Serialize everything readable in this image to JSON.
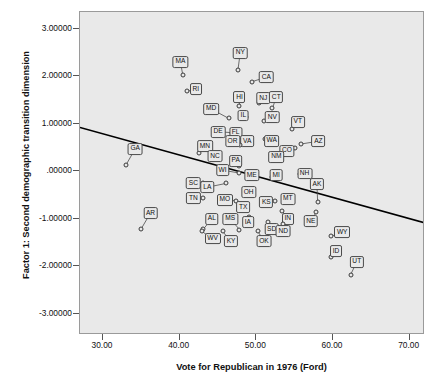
{
  "chart_data": {
    "type": "scatter",
    "title": "",
    "xlabel": "Vote for Republican in 1976 (Ford)",
    "ylabel": "Factor 1: Second demographic transition dimension",
    "xlim": [
      27.0,
      72.0
    ],
    "ylim": [
      -3.45,
      3.35
    ],
    "xticks": [
      "30.00",
      "40.00",
      "50.00",
      "60.00",
      "70.00"
    ],
    "xtick_values": [
      30,
      40,
      50,
      60,
      70
    ],
    "yticks": [
      "3.00000",
      "2.00000",
      "1.00000",
      ".00000",
      "-1.00000",
      "-2.00000",
      "-3.00000"
    ],
    "ytick_values": [
      3,
      2,
      1,
      0,
      -1,
      -2,
      -3
    ],
    "grid": false,
    "legend": null,
    "point_labels": true,
    "background_color": "#e9e9e9",
    "marker_color": "#3a3a3a",
    "line_color": "#000000",
    "fit_line": {
      "type": "linear-regression",
      "x_start": 27.0,
      "y_start": 0.92,
      "x_end": 72.0,
      "y_end": -1.09
    },
    "points": [
      {
        "label": "MA",
        "x": 40.4,
        "y": 2.03,
        "lx": 40.1,
        "ly": 2.3
      },
      {
        "label": "NY",
        "x": 47.6,
        "y": 2.13,
        "lx": 47.9,
        "ly": 2.49
      },
      {
        "label": "CA",
        "x": 49.4,
        "y": 1.88,
        "lx": 51.3,
        "ly": 1.98
      },
      {
        "label": "RI",
        "x": 41.0,
        "y": 1.68,
        "lx": 42.1,
        "ly": 1.73
      },
      {
        "label": "HI",
        "x": 47.8,
        "y": 1.38,
        "lx": 47.8,
        "ly": 1.56
      },
      {
        "label": "NJ",
        "x": 50.4,
        "y": 1.43,
        "lx": 50.9,
        "ly": 1.54
      },
      {
        "label": "CT",
        "x": 52.1,
        "y": 1.32,
        "lx": 52.6,
        "ly": 1.56
      },
      {
        "label": "MD",
        "x": 46.4,
        "y": 1.11,
        "lx": 44.1,
        "ly": 1.31
      },
      {
        "label": "IL",
        "x": 48.6,
        "y": 1.13,
        "lx": 48.3,
        "ly": 1.17
      },
      {
        "label": "NV",
        "x": 51.0,
        "y": 1.05,
        "lx": 52.1,
        "ly": 1.13
      },
      {
        "label": "VT",
        "x": 54.6,
        "y": 0.88,
        "lx": 55.4,
        "ly": 1.04
      },
      {
        "label": "DE",
        "x": 46.8,
        "y": 0.81,
        "lx": 45.0,
        "ly": 0.83
      },
      {
        "label": "FL",
        "x": 47.8,
        "y": 0.79,
        "lx": 47.3,
        "ly": 0.81
      },
      {
        "label": "WA",
        "x": 51.1,
        "y": 0.68,
        "lx": 52.0,
        "ly": 0.64
      },
      {
        "label": "VA",
        "x": 49.0,
        "y": 0.67,
        "lx": 48.8,
        "ly": 0.63
      },
      {
        "label": "OR",
        "x": 47.9,
        "y": 0.56,
        "lx": 46.9,
        "ly": 0.63
      },
      {
        "label": "AZ",
        "x": 55.8,
        "y": 0.57,
        "lx": 58.1,
        "ly": 0.63
      },
      {
        "label": "MN",
        "x": 42.5,
        "y": 0.38,
        "lx": 43.3,
        "ly": 0.53
      },
      {
        "label": "CO",
        "x": 55.1,
        "y": 0.48,
        "lx": 54.0,
        "ly": 0.43
      },
      {
        "label": "NC",
        "x": 44.2,
        "y": 0.25,
        "lx": 44.6,
        "ly": 0.32
      },
      {
        "label": "NM",
        "x": 52.3,
        "y": 0.23,
        "lx": 52.6,
        "ly": 0.3
      },
      {
        "label": "GA",
        "x": 33.0,
        "y": 0.13,
        "lx": 34.2,
        "ly": 0.47
      },
      {
        "label": "PA",
        "x": 47.7,
        "y": 0.1,
        "lx": 47.3,
        "ly": 0.22
      },
      {
        "label": "WI",
        "x": 47.8,
        "y": -0.04,
        "lx": 45.6,
        "ly": 0.02
      },
      {
        "label": "NH",
        "x": 55.7,
        "y": -0.06,
        "lx": 56.3,
        "ly": -0.05
      },
      {
        "label": "ME",
        "x": 49.0,
        "y": -0.11,
        "lx": 49.4,
        "ly": -0.09
      },
      {
        "label": "MI",
        "x": 52.1,
        "y": -0.13,
        "lx": 52.6,
        "ly": -0.08
      },
      {
        "label": "SC",
        "x": 43.1,
        "y": -0.25,
        "lx": 41.8,
        "ly": -0.25
      },
      {
        "label": "LA",
        "x": 46.0,
        "y": -0.26,
        "lx": 43.6,
        "ly": -0.34
      },
      {
        "label": "OH",
        "x": 48.7,
        "y": -0.37,
        "lx": 49.0,
        "ly": -0.44
      },
      {
        "label": "AK",
        "x": 58.0,
        "y": -0.65,
        "lx": 57.9,
        "ly": -0.28
      },
      {
        "label": "TN",
        "x": 43.0,
        "y": -0.57,
        "lx": 41.8,
        "ly": -0.57
      },
      {
        "label": "MT",
        "x": 53.7,
        "y": -0.55,
        "lx": 54.1,
        "ly": -0.58
      },
      {
        "label": "MO",
        "x": 47.3,
        "y": -0.62,
        "lx": 45.9,
        "ly": -0.6
      },
      {
        "label": "KS",
        "x": 52.4,
        "y": -0.62,
        "lx": 51.3,
        "ly": -0.65
      },
      {
        "label": "TX",
        "x": 48.6,
        "y": -0.78,
        "lx": 48.3,
        "ly": -0.76
      },
      {
        "label": "AR",
        "x": 35.0,
        "y": -1.21,
        "lx": 36.2,
        "ly": -0.88
      },
      {
        "label": "NE",
        "x": 57.8,
        "y": -0.87,
        "lx": 57.1,
        "ly": -1.05
      },
      {
        "label": "IN",
        "x": 53.4,
        "y": -0.84,
        "lx": 54.1,
        "ly": -1.0
      },
      {
        "label": "AL",
        "x": 43.1,
        "y": -1.22,
        "lx": 44.2,
        "ly": -1.0
      },
      {
        "label": "MS",
        "x": 47.8,
        "y": -1.23,
        "lx": 46.6,
        "ly": -1.0
      },
      {
        "label": "IA",
        "x": 49.0,
        "y": -0.96,
        "lx": 48.9,
        "ly": -1.07
      },
      {
        "label": "SD",
        "x": 51.5,
        "y": -1.08,
        "lx": 52.0,
        "ly": -1.22
      },
      {
        "label": "ND",
        "x": 53.5,
        "y": -1.12,
        "lx": 53.5,
        "ly": -1.27
      },
      {
        "label": "WV",
        "x": 42.9,
        "y": -1.27,
        "lx": 44.3,
        "ly": -1.42
      },
      {
        "label": "KY",
        "x": 45.6,
        "y": -1.27,
        "lx": 46.7,
        "ly": -1.48
      },
      {
        "label": "OK",
        "x": 50.2,
        "y": -1.27,
        "lx": 51.0,
        "ly": -1.47
      },
      {
        "label": "WY",
        "x": 59.8,
        "y": -1.37,
        "lx": 61.2,
        "ly": -1.28
      },
      {
        "label": "ID",
        "x": 59.8,
        "y": -1.8,
        "lx": 60.4,
        "ly": -1.68
      },
      {
        "label": "UT",
        "x": 62.3,
        "y": -2.18,
        "lx": 63.1,
        "ly": -1.91
      }
    ]
  }
}
